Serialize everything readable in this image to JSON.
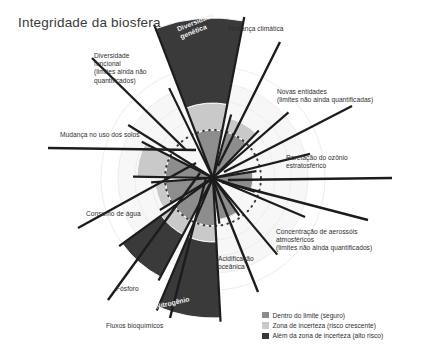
{
  "title": "Integridade da biosfera",
  "colors": {
    "safe": "#8d8d8d",
    "uncertainty": "#c9c9c9",
    "beyond": "#3a3a3a",
    "background_rings": "#ededed",
    "boundary_dotted": "#3a3a3a",
    "spoke": "#1c1c1c",
    "page_background": "#ffffff",
    "text": "#2f2f2f",
    "inwedge_text": "#f2f2f2"
  },
  "legend": {
    "items": [
      {
        "label": "Dentro do limite (seguro)",
        "color": "#8d8d8d",
        "key": "safe"
      },
      {
        "label": "Zona de incerteza (risco crescente)",
        "color": "#c9c9c9",
        "key": "uncertainty"
      },
      {
        "label": "Além da zona de incerteza (alto risco)",
        "color": "#3a3a3a",
        "key": "beyond"
      }
    ]
  },
  "chart_data": {
    "type": "radial_bar",
    "title": "Integridade da biosfera",
    "center": {
      "x": 213,
      "y": 178
    },
    "boundary_radius": 48,
    "grid": {
      "rings": [
        22,
        34,
        48,
        62,
        78,
        95,
        112
      ],
      "dotted_boundary_ring": 48
    },
    "legend_position": "bottom-right",
    "categories": [
      "Diversidade genética",
      "Mudança climática",
      "Novas entidades",
      "Rarefação do ozônio estratosférico",
      "Concentração de aerossóis atmosféricos",
      "Acidificação oceânica",
      "Nitrogênio",
      "Fósforo",
      "Consumo de água",
      "Mudança no uso dos solos",
      "Diversidade funcional"
    ],
    "wedges": [
      {
        "name": "Diversidade genética",
        "angle_start": -111,
        "angle_end": -79,
        "quantified": true,
        "segments": [
          {
            "zone": "safe",
            "r0": 0,
            "r1": 48
          },
          {
            "zone": "uncertainty",
            "r0": 48,
            "r1": 75
          },
          {
            "zone": "beyond",
            "r0": 75,
            "r1": 160
          }
        ]
      },
      {
        "name": "Mudança climática",
        "angle_start": -74,
        "angle_end": -46,
        "quantified": true,
        "segments": [
          {
            "zone": "safe",
            "r0": 0,
            "r1": 48
          },
          {
            "zone": "uncertainty",
            "r0": 48,
            "r1": 62
          }
        ]
      },
      {
        "name": "Novas entidades",
        "angle_start": -41,
        "angle_end": -14,
        "quantified": false,
        "segments": []
      },
      {
        "name": "Rarefação do ozônio estratosférico",
        "angle_start": -9,
        "angle_end": 18,
        "quantified": true,
        "segments": [
          {
            "zone": "safe",
            "r0": 0,
            "r1": 40
          }
        ]
      },
      {
        "name": "Concentração de aerossóis atmosféricos",
        "angle_start": 23,
        "angle_end": 50,
        "quantified": false,
        "segments": []
      },
      {
        "name": "Acidificação oceânica",
        "angle_start": 55,
        "angle_end": 82,
        "quantified": true,
        "segments": [
          {
            "zone": "safe",
            "r0": 0,
            "r1": 42
          }
        ]
      },
      {
        "name": "Nitrogênio",
        "angle_start": 87,
        "angle_end": 113,
        "quantified": true,
        "segments": [
          {
            "zone": "safe",
            "r0": 0,
            "r1": 48
          },
          {
            "zone": "uncertainty",
            "r0": 48,
            "r1": 64
          },
          {
            "zone": "beyond",
            "r0": 64,
            "r1": 140
          }
        ]
      },
      {
        "name": "Fósforo",
        "angle_start": 118,
        "angle_end": 144,
        "quantified": true,
        "segments": [
          {
            "zone": "safe",
            "r0": 0,
            "r1": 48
          },
          {
            "zone": "uncertainty",
            "r0": 48,
            "r1": 64
          },
          {
            "zone": "beyond",
            "r0": 64,
            "r1": 112
          }
        ]
      },
      {
        "name": "Consumo de água",
        "angle_start": 149,
        "angle_end": 176,
        "quantified": true,
        "segments": [
          {
            "zone": "safe",
            "r0": 0,
            "r1": 48
          },
          {
            "zone": "uncertainty",
            "r0": 48,
            "r1": 58
          }
        ]
      },
      {
        "name": "Mudança no uso dos solos",
        "angle_start": -179,
        "angle_end": -153,
        "quantified": true,
        "segments": [
          {
            "zone": "safe",
            "r0": 0,
            "r1": 48
          },
          {
            "zone": "uncertainty",
            "r0": 48,
            "r1": 76
          }
        ]
      },
      {
        "name": "Diversidade funcional",
        "angle_start": -148,
        "angle_end": -116,
        "quantified": false,
        "segments": []
      }
    ]
  },
  "labels": [
    {
      "id": "diversidade-genetica",
      "lines": [
        "Diversidade",
        "genética"
      ],
      "x": 176,
      "y": 26,
      "align": "left",
      "in_wedge": true,
      "rotate": -22
    },
    {
      "id": "mudanca-climatica",
      "lines": [
        "Mudança climática"
      ],
      "x": 228,
      "y": 25,
      "align": "left",
      "in_wedge": false,
      "rotate": 0
    },
    {
      "id": "novas-entidades",
      "lines": [
        "Novas entidades",
        "(limites não ainda quantificadas)"
      ],
      "x": 277,
      "y": 88,
      "align": "left",
      "in_wedge": false,
      "rotate": 0
    },
    {
      "id": "rarefacao-ozonio",
      "lines": [
        "Rarefação do ozônio",
        "estratosférico"
      ],
      "x": 286,
      "y": 154,
      "align": "left",
      "in_wedge": false,
      "rotate": 0
    },
    {
      "id": "aerossois",
      "lines": [
        "Concentração de aerossóis",
        "atmosféricos",
        "(limites não ainda quantificados)"
      ],
      "x": 276,
      "y": 228,
      "align": "left",
      "in_wedge": false,
      "rotate": 0
    },
    {
      "id": "acidificacao-oceanica",
      "lines": [
        "Acidificação",
        "oceânica"
      ],
      "x": 218,
      "y": 255,
      "align": "left",
      "in_wedge": false,
      "rotate": 0
    },
    {
      "id": "nitrogenio",
      "lines": [
        "Nitrogênio"
      ],
      "x": 155,
      "y": 303,
      "align": "left",
      "in_wedge": true,
      "rotate": -13
    },
    {
      "id": "fluxos-bioquimicos",
      "lines": [
        "Fluxos bioquímicos"
      ],
      "x": 106,
      "y": 322,
      "align": "left",
      "in_wedge": false,
      "rotate": 0
    },
    {
      "id": "fosforo",
      "lines": [
        "Fósforo"
      ],
      "x": 116,
      "y": 285,
      "align": "left",
      "in_wedge": false,
      "rotate": 0
    },
    {
      "id": "consumo-de-agua",
      "lines": [
        "Consumo de água"
      ],
      "x": 86,
      "y": 210,
      "align": "left",
      "in_wedge": false,
      "rotate": 0
    },
    {
      "id": "mudanca-uso-solos",
      "lines": [
        "Mudança no uso dos solos"
      ],
      "x": 60,
      "y": 131,
      "align": "left",
      "in_wedge": false,
      "rotate": 0
    },
    {
      "id": "diversidade-funcional",
      "lines": [
        "Diversidade",
        "funcional",
        "(limites ainda não",
        "quantificados)"
      ],
      "x": 94,
      "y": 52,
      "align": "left",
      "in_wedge": false,
      "rotate": 0
    }
  ],
  "leader_lines": [
    {
      "id": "leader-diversidade-funcional",
      "x1": 92,
      "y1": 58,
      "x2": 186,
      "y2": 150
    },
    {
      "id": "leader-mudanca-uso-solos",
      "x1": 48,
      "y1": 148,
      "x2": 196,
      "y2": 150
    },
    {
      "id": "leader-consumo-agua",
      "x1": 78,
      "y1": 228,
      "x2": 196,
      "y2": 163
    },
    {
      "id": "leader-fosforo",
      "x1": 108,
      "y1": 300,
      "x2": 200,
      "y2": 173
    },
    {
      "id": "leader-fluxos",
      "x1": 170,
      "y1": 318,
      "x2": 206,
      "y2": 178
    },
    {
      "id": "leader-acidificacao",
      "x1": 258,
      "y1": 292,
      "x2": 214,
      "y2": 182
    },
    {
      "id": "leader-aerossois",
      "x1": 368,
      "y1": 220,
      "x2": 222,
      "y2": 182
    },
    {
      "id": "leader-rarefacao",
      "x1": 392,
      "y1": 178,
      "x2": 228,
      "y2": 180
    },
    {
      "id": "leader-novas-entidades",
      "x1": 352,
      "y1": 106,
      "x2": 224,
      "y2": 172
    },
    {
      "id": "leader-mudanca-climatica",
      "x1": 280,
      "y1": 42,
      "x2": 218,
      "y2": 166
    }
  ]
}
